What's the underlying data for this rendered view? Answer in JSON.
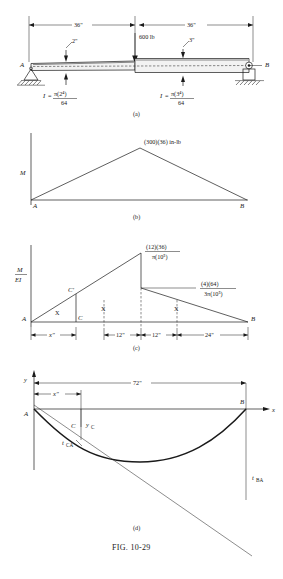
{
  "figure": {
    "caption": "FIG.  10-29",
    "panels": [
      {
        "id": "a",
        "label": "(a)"
      },
      {
        "id": "b",
        "label": "(b)"
      },
      {
        "id": "c",
        "label": "(c)"
      },
      {
        "id": "d",
        "label": "(d)"
      }
    ]
  },
  "panel_a": {
    "title": "Stepped shaft beam with concentrated load",
    "dim_left": "36\"",
    "dim_right": "36\"",
    "load_label": "600 lb",
    "diameter_left": "2\"",
    "diameter_right": "3\"",
    "support_left_label": "A",
    "support_right_label": "B",
    "inertia_left": {
      "symbol": "I",
      "equals": "=",
      "numerator": "π(2⁴)",
      "denominator": "64"
    },
    "inertia_right": {
      "symbol": "I",
      "equals": "=",
      "numerator": "π(3⁴)",
      "denominator": "64"
    },
    "panel_label": "(a)"
  },
  "panel_b": {
    "title": "Bending moment diagram",
    "axis_label": "M",
    "peak_label": "(300)(36) in-lb",
    "point_left": "A",
    "point_right": "B",
    "panel_label": "(b)"
  },
  "panel_c": {
    "title": "M over EI diagram",
    "axis_label_num": "M",
    "axis_label_den": "EI",
    "peak_label": {
      "numerator": "(12)(36)",
      "denominator": "π(10⁵)"
    },
    "step_label": {
      "numerator": "(4)(64)",
      "denominator": "3π(10⁵)"
    },
    "point_left": "A",
    "point_right": "B",
    "point_c": "C",
    "point_c_prime": "C′",
    "centroid_marker": "X",
    "dims": [
      "x\"",
      "12\"",
      "12\"",
      "24\""
    ],
    "panel_label": "(c)"
  },
  "panel_d": {
    "title": "Elastic curve with tangential deviations",
    "axis_y": "y",
    "axis_x": "x",
    "span_label": "72\"",
    "dim_x": "x\"",
    "point_a": "A",
    "point_b": "B",
    "point_c": "C",
    "deflection_c": "y",
    "deflection_c_sub": "C",
    "dev_ca": "t",
    "dev_ca_sub": "CA",
    "dev_ba": "t",
    "dev_ba_sub": "BA",
    "panel_label": "(d)"
  },
  "colors": {
    "ink": "#1a1a1a",
    "paper": "#ffffff"
  }
}
